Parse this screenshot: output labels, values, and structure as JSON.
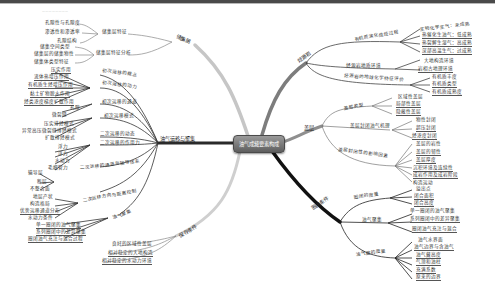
{
  "header": {
    "faint_text": "————————"
  },
  "center": {
    "label": "油气成藏要素构成"
  },
  "branches": {
    "reservoir": {
      "label": "储集层",
      "groups": [
        {
          "label": "储集层特征",
          "items": [
            "孔隙性与孔隙度",
            "渗透性和渗透率",
            "孔隙结构"
          ]
        },
        {
          "label": "储集层特征分析",
          "items": [
            "储集空间类型",
            "储集层的储集物性",
            "储集体类型特征"
          ]
        }
      ]
    },
    "migration": {
      "label": "油气运移与聚集",
      "groups": [
        {
          "label": "初次运移的概念",
          "items": []
        },
        {
          "label": "初次运移的动力",
          "items": [
            "压实作用",
            "流体热增压作用",
            "有机质生烃增压作用",
            "黏土矿物脱水作用",
            "烃类浓度梯度扩散作用"
          ]
        },
        {
          "label": "初次运移的通道",
          "items": [
            "孔隙",
            "微裂缝"
          ]
        },
        {
          "label": "初次运移模式",
          "items": [
            "压实排烃模式",
            "异常高压微裂缝排烃模式",
            "扩散排烃模式"
          ]
        },
        {
          "label": "二次运移的动态",
          "items": []
        },
        {
          "label": "二次运移的作用力",
          "items": [
            "浮力",
            "浮力",
            "水动力",
            "毛细管力"
          ]
        },
        {
          "label": "二次运移的通道与输导体系",
          "items": [
            "输导层",
            "断层",
            "不整合面"
          ]
        },
        {
          "label": "二次运移方向与距离控制",
          "items": [
            "地层产状",
            "构造格局",
            "优势运移通道分布",
            "水动力条件"
          ]
        },
        {
          "label": "油气聚集",
          "items": [
            "单一圈闭的油气聚集",
            "系列圈闭中的差异聚集",
            "圈闭油气充注与混合过程"
          ]
        }
      ]
    },
    "preservation": {
      "label": "保存条件",
      "items": [
        "良好的区域性盖层",
        "相对稳定的大地构造",
        "相对稳定的水动力环境"
      ]
    },
    "source": {
      "label": "烃源岩",
      "groups": [
        {
          "label": "有机质演化成烃过程",
          "items": [
            "生物化学生气：未成熟",
            "热催化生油气：低成熟",
            "热裂解生湿气：高成熟",
            "深部高温生气：过成熟"
          ]
        },
        {
          "label": "烃源岩地质环境",
          "items": [
            "大地构造环境",
            "岩相古地理环境"
          ]
        },
        {
          "label": "烃源岩的地球化学特征评价",
          "items": [
            "有机质丰度",
            "有机质类型",
            "有机质成熟度"
          ]
        }
      ]
    },
    "caprock": {
      "label": "盖层",
      "groups": [
        {
          "label": "盖层类型",
          "items": [
            "区域性盖层",
            "局部性盖层",
            "隐蔽性盖层"
          ]
        },
        {
          "label": "盖层封闭油气机理",
          "items": [
            "物性封闭",
            "超压封闭",
            "烃浓度封闭"
          ]
        },
        {
          "label": "盖层封闭性的影响因素",
          "items": [
            "盖层的岩性",
            "盖层的韧性",
            "盖层厚度",
            "沉积环境及连续性",
            "成岩作用及成岩阶段",
            "构造运动"
          ]
        }
      ]
    },
    "trap": {
      "label": "圈闭条件",
      "groups": [
        {
          "label": "圈闭的度量",
          "items": [
            "溢出点",
            "闭合面积",
            "闭合高度"
          ]
        },
        {
          "label": "油气聚集",
          "items": [
            "单一圈闭的油气聚集",
            "系列圈闭中的差异聚集",
            "圈闭油气充注与混合"
          ]
        },
        {
          "label": "油气藏的度量",
          "items": [
            "油气水界面",
            "油气边界与含油气",
            "油气藏高度",
            "气顶和油柱",
            "充满系数",
            "原来的边界"
          ]
        }
      ]
    }
  }
}
